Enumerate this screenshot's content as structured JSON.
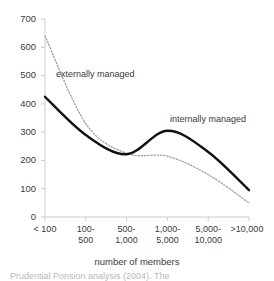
{
  "chart_data": {
    "type": "line",
    "title": "",
    "xlabel": "number of members",
    "ylabel": "",
    "ylim": [
      0,
      700
    ],
    "ytick_values": [
      0,
      100,
      200,
      300,
      400,
      500,
      600,
      700
    ],
    "ytick_labels": [
      "0",
      "100",
      "200",
      "300",
      "400",
      "500",
      "600",
      "700"
    ],
    "grid": false,
    "legend_position": "inline-annotations",
    "categories": [
      "< 100",
      "100-500",
      "500-1,000",
      "1,000-5,000",
      "5,000-10,000",
      ">10,000"
    ],
    "category_label_lines": [
      [
        "< 100",
        ""
      ],
      [
        "100-",
        "500"
      ],
      [
        "500-",
        "1,000"
      ],
      [
        "1,000-",
        "5,000"
      ],
      [
        "5,000-",
        "10,000"
      ],
      [
        ">10,000",
        ""
      ]
    ],
    "series": [
      {
        "name": "externally managed",
        "style": "dotted",
        "color": "#999999",
        "values": [
          640,
          330,
          225,
          215,
          150,
          50
        ]
      },
      {
        "name": "internally managed",
        "style": "solid",
        "color": "#111111",
        "values": [
          425,
          290,
          222,
          305,
          230,
          95
        ]
      }
    ],
    "annotations": [
      {
        "text": "externally managed",
        "series": "externally managed"
      },
      {
        "text": "internally managed",
        "series": "internally managed"
      }
    ],
    "axis_color": "#cccccc"
  },
  "caption": {
    "text": "Prudential Ponsion analysis (2004). The"
  }
}
